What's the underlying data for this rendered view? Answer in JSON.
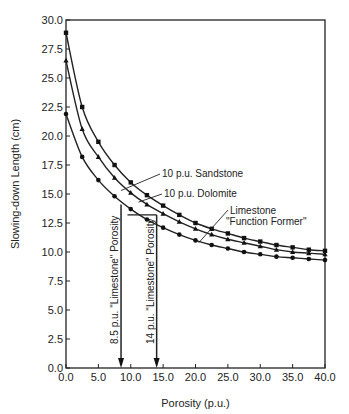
{
  "chart_data": {
    "type": "line",
    "title": "",
    "xlabel": "Porosity (p.u.)",
    "ylabel": "Slowing-down Length (cm)",
    "xlim": [
      0,
      40
    ],
    "ylim": [
      0,
      30
    ],
    "xticks": [
      "0.0",
      "5.0",
      "10.0",
      "15.0",
      "20.0",
      "25.0",
      "30.0",
      "35.0",
      "40.0"
    ],
    "yticks": [
      "0.0",
      "2.5",
      "5.0",
      "7.5",
      "10.0",
      "12.5",
      "15.0",
      "17.5",
      "20.0",
      "22.5",
      "25.0",
      "27.5",
      "30.0"
    ],
    "grid": false,
    "legend": "inline annotations",
    "series": [
      {
        "name": "10 p.u. Sandstone",
        "marker": "square",
        "x": [
          0,
          2.5,
          5,
          7.5,
          10,
          12.5,
          15,
          17.5,
          20,
          22.5,
          25,
          27.5,
          30,
          32.5,
          35,
          37.5,
          40
        ],
        "y": [
          28.9,
          22.5,
          19.5,
          17.5,
          16.0,
          14.9,
          14.0,
          13.2,
          12.5,
          12.0,
          11.6,
          11.2,
          10.9,
          10.6,
          10.4,
          10.2,
          10.1
        ]
      },
      {
        "name": "10 p.u. Dolomite",
        "marker": "triangle",
        "x": [
          0,
          2.5,
          5,
          7.5,
          10,
          12.5,
          15,
          17.5,
          20,
          22.5,
          25,
          27.5,
          30,
          32.5,
          35,
          37.5,
          40
        ],
        "y": [
          26.5,
          20.6,
          18.2,
          16.4,
          15.1,
          14.1,
          13.3,
          12.6,
          12.0,
          11.5,
          11.1,
          10.8,
          10.5,
          10.2,
          10.0,
          9.9,
          9.8
        ]
      },
      {
        "name": "Limestone \"Function Former\"",
        "marker": "circle",
        "x": [
          0,
          2.5,
          5,
          7.5,
          10,
          12.5,
          15,
          17.5,
          20,
          22.5,
          25,
          27.5,
          30,
          32.5,
          35,
          37.5,
          40
        ],
        "y": [
          21.9,
          18.2,
          16.2,
          14.8,
          13.7,
          12.8,
          12.1,
          11.5,
          11.0,
          10.6,
          10.3,
          10.0,
          9.8,
          9.6,
          9.5,
          9.4,
          9.3
        ]
      }
    ],
    "annotations": [
      {
        "text": "10 p.u. Sandstone",
        "x": 14.5,
        "y": 16.6
      },
      {
        "text": "10 p.u. Dolomite",
        "x": 15,
        "y": 15.0
      },
      {
        "text": "Limestone",
        "x": 23,
        "y": 13.5
      },
      {
        "text": "\"Function Former\"",
        "x": 23,
        "y": 12.5
      },
      {
        "text": "8.5 p.u. \"Limestone\" Porosity",
        "x": 8.5,
        "rotated": true
      },
      {
        "text": "14 p.u. \"Limestone\" Porosity",
        "x": 14,
        "rotated": true
      }
    ],
    "arrows": [
      {
        "x": 8.5,
        "from_y": 14.1,
        "to_y": 0
      },
      {
        "x": 14,
        "from_y": 13.2,
        "to_y": 0
      }
    ],
    "horizontal_link": {
      "y": 13.2,
      "x_from": 9.5,
      "x_to": 14
    }
  }
}
